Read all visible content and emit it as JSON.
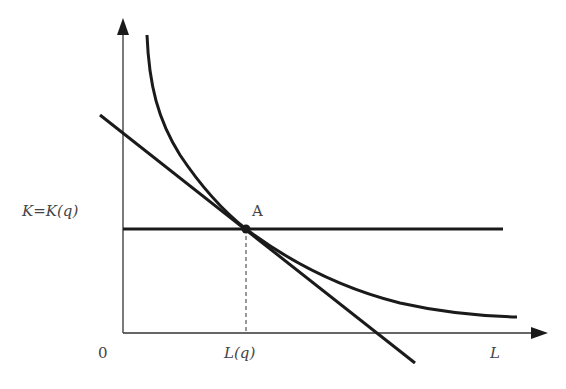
{
  "diagram": {
    "type": "isoquant-isocost",
    "axes": {
      "x_label": "L",
      "origin_label": "0",
      "y_label": ""
    },
    "labels": {
      "k_level": "K=K(q)",
      "l_level": "L(q)",
      "point": "A"
    },
    "elements": [
      {
        "name": "isoquant-curve",
        "description": "convex curve decreasing toward x-axis"
      },
      {
        "name": "isocost-line",
        "description": "straight downward-sloping line tangent at A"
      },
      {
        "name": "fixed-capital-line",
        "description": "horizontal line at K=K(q)"
      },
      {
        "name": "dashed-drop-line",
        "description": "vertical dashed line from A to L(q)"
      }
    ],
    "colors": {
      "stroke": "#1a1a1a",
      "axis": "#333333",
      "text": "#444444"
    }
  }
}
